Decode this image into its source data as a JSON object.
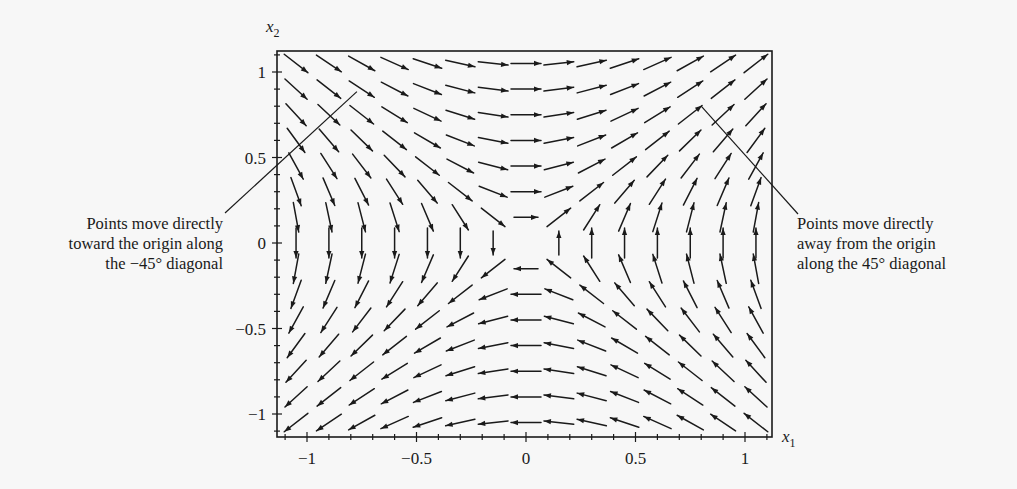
{
  "chart_data": {
    "type": "quiver",
    "title": "",
    "xlabel": "x1",
    "ylabel": "x2",
    "xlim": [
      -1.13,
      1.13
    ],
    "ylim": [
      -1.13,
      1.13
    ],
    "x_ticks": [
      -1,
      -0.5,
      0,
      0.5,
      1
    ],
    "x_tick_labels": [
      "−1",
      "−0.5",
      "0",
      "0.5",
      "1"
    ],
    "y_ticks": [
      -1,
      -0.5,
      0,
      0.5,
      1
    ],
    "y_tick_labels": [
      "−1",
      "−0.5",
      "0",
      "0.5",
      "1"
    ],
    "minor_tick_step": 0.1,
    "grid": false,
    "vector_field": {
      "description": "dx1/dt = x2, dx2/dt = x1 (saddle point at origin)",
      "x_min": -1.05,
      "x_max": 1.05,
      "y_min": -1.05,
      "y_max": 1.05,
      "step": 0.15,
      "u_expr": "x2",
      "v_expr": "x1"
    },
    "annotations": [
      {
        "lines": [
          "Points move directly",
          "toward the origin along",
          "the −45° diagonal"
        ],
        "pointer_target": [
          -0.9,
          0.85
        ],
        "side": "left"
      },
      {
        "lines": [
          "Points move directly",
          "away from the origin",
          "along the 45° diagonal"
        ],
        "pointer_target": [
          0.8,
          0.8
        ],
        "side": "right"
      }
    ],
    "colors": {
      "ink": "#1a1a1a",
      "background": "#f7f7f7"
    }
  },
  "labels": {
    "x_axis": "x",
    "x_axis_sub": "1",
    "y_axis": "x",
    "y_axis_sub": "2"
  },
  "annotations": {
    "left": [
      "Points move directly",
      "toward the origin along",
      "the −45° diagonal"
    ],
    "right": [
      "Points move directly",
      "away from the origin",
      "along the 45° diagonal"
    ]
  }
}
